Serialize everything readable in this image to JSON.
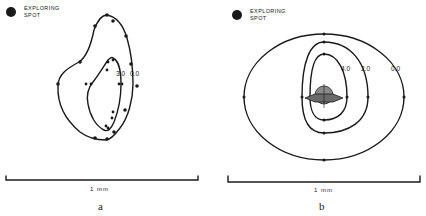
{
  "figure": {
    "panels": [
      {
        "id": "a",
        "panel_label": "a",
        "legend": {
          "line1": "Exploring",
          "line2": "Spot"
        },
        "contour_labels": [
          "3.0",
          "0.0"
        ],
        "scale_bar_label": "1 mm"
      },
      {
        "id": "b",
        "panel_label": "b",
        "legend": {
          "line1": "Exploring",
          "line2": "Spot"
        },
        "contour_labels": [
          "4.0",
          "2.0",
          "0.0"
        ],
        "scale_bar_label": "1 mm"
      }
    ],
    "ink_color": "#1a1a1a",
    "shade_color": "#8a8a8a"
  }
}
